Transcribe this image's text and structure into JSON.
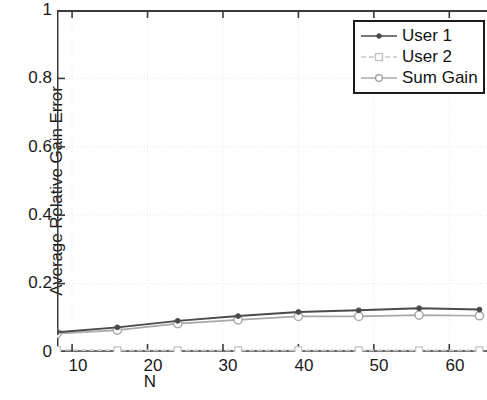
{
  "chart_data": {
    "type": "line",
    "title": "",
    "xlabel": "N",
    "ylabel": "Average Relative Gain Error",
    "xlim": [
      8,
      65
    ],
    "ylim": [
      0,
      1
    ],
    "xticks": [
      10,
      20,
      30,
      40,
      50,
      60
    ],
    "yticks": [
      0,
      0.2,
      0.4,
      0.6,
      0.8,
      1
    ],
    "ytick_labels": [
      "0",
      "0.2",
      "0.4",
      "0.6",
      "0.8",
      "1"
    ],
    "xtick_labels": [
      "10",
      "20",
      "30",
      "40",
      "50",
      "60"
    ],
    "grid": true,
    "legend_position": "top-right",
    "x": [
      8,
      16,
      24,
      32,
      40,
      48,
      56,
      64
    ],
    "series": [
      {
        "name": "User 1",
        "color": "#4a4a4a",
        "marker": "dot",
        "linestyle": "solid",
        "values": [
          0.058,
          0.072,
          0.091,
          0.105,
          0.117,
          0.122,
          0.128,
          0.124
        ]
      },
      {
        "name": "User 2",
        "color": "#c8c8c8",
        "marker": "square",
        "linestyle": "dashed",
        "values": [
          0.006,
          0.005,
          0.005,
          0.005,
          0.005,
          0.005,
          0.005,
          0.005
        ]
      },
      {
        "name": "Sum Gain",
        "color": "#a8a8a8",
        "marker": "circle",
        "linestyle": "solid",
        "values": [
          0.054,
          0.064,
          0.083,
          0.094,
          0.104,
          0.104,
          0.108,
          0.106
        ]
      }
    ]
  },
  "axes": {
    "ylabel": "Average Relative Gain Error",
    "xlabel": "N",
    "ytick_labels": [
      "1",
      "0.8",
      "0.6",
      "0.4",
      "0.2",
      "0"
    ],
    "xtick_labels": [
      "10",
      "20",
      "30",
      "40",
      "50",
      "60"
    ]
  },
  "legend": {
    "entries": [
      {
        "label": "User 1"
      },
      {
        "label": "User 2"
      },
      {
        "label": "Sum Gain"
      }
    ]
  },
  "colors": {
    "user1": "#4a4a4a",
    "user2": "#c8c8c8",
    "sum_gain": "#a8a8a8",
    "axis": "#3a3a3a",
    "grid": "#e8e8e8"
  }
}
